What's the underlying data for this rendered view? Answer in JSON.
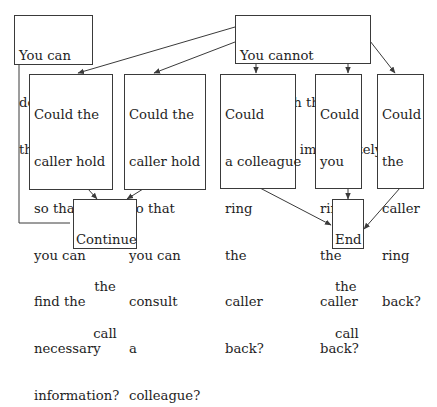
{
  "diagram": {
    "type": "flowchart",
    "colors": {
      "line": "#3a3a3a",
      "text": "#1e1e1e",
      "background": "#ffffff"
    },
    "nodes": {
      "can_deal": {
        "lines": [
          "You can",
          "deal with",
          "the problem"
        ]
      },
      "cannot_deal": {
        "lines": [
          "You cannot",
          "deal with the",
          "problem immediately"
        ]
      },
      "hold_find": {
        "lines": [
          "Could the",
          "caller hold",
          "so that",
          "you can",
          "find the",
          "necessary",
          "information?"
        ]
      },
      "hold_consult": {
        "lines": [
          "Could the",
          "caller hold",
          "so that",
          "you can",
          "consult",
          "a",
          "colleague?"
        ]
      },
      "colleague_ring": {
        "lines": [
          "Could",
          "a colleague",
          "ring",
          "the",
          "caller",
          "back?"
        ]
      },
      "you_ring": {
        "lines": [
          "Could",
          "you",
          "ring",
          "the",
          "caller",
          "back?"
        ]
      },
      "caller_ring": {
        "lines": [
          "Could",
          "the",
          "caller",
          "ring",
          "back?"
        ]
      },
      "continue_call": {
        "lines": [
          "Continue",
          "the",
          "call"
        ]
      },
      "end_call": {
        "lines": [
          "End",
          "the",
          "call"
        ]
      }
    },
    "edges": [
      {
        "from": "cannot_deal",
        "to": "hold_find"
      },
      {
        "from": "cannot_deal",
        "to": "hold_consult"
      },
      {
        "from": "cannot_deal",
        "to": "colleague_ring"
      },
      {
        "from": "cannot_deal",
        "to": "you_ring"
      },
      {
        "from": "cannot_deal",
        "to": "caller_ring"
      },
      {
        "from": "can_deal",
        "to": "continue_call"
      },
      {
        "from": "hold_find",
        "to": "continue_call"
      },
      {
        "from": "hold_consult",
        "to": "continue_call"
      },
      {
        "from": "colleague_ring",
        "to": "end_call"
      },
      {
        "from": "you_ring",
        "to": "end_call"
      },
      {
        "from": "caller_ring",
        "to": "end_call"
      }
    ]
  }
}
